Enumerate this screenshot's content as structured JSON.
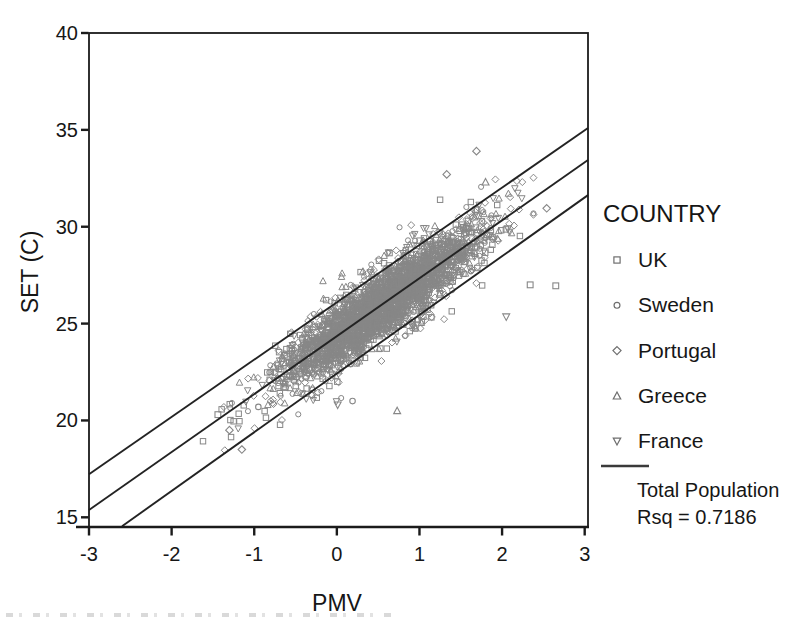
{
  "window": {
    "width": 793,
    "height": 618,
    "background": "#ffffff"
  },
  "chart_data": {
    "type": "scatter",
    "title": "",
    "xlabel": "PMV",
    "ylabel": "SET (C)",
    "xlim": [
      -3,
      3.04
    ],
    "ylim": [
      14.5,
      40
    ],
    "x_ticks": [
      -3,
      -2,
      -1,
      0,
      1,
      2,
      3
    ],
    "y_ticks": [
      15,
      20,
      25,
      30,
      35,
      40
    ],
    "grid": false,
    "legend_position": "right",
    "colors": {
      "marker": "#878787",
      "legend_marker": "#6e6e6e",
      "fit_line": "#232323",
      "axis": "#1b1b1b",
      "text": "#161616",
      "background": "#ffffff"
    },
    "fit_lines": [
      {
        "name": "upper-prediction-band",
        "slope": 2.96,
        "intercept": 26.1,
        "x_start": -3.0,
        "x_end": 3.04
      },
      {
        "name": "total-population-fit",
        "slope": 2.99,
        "intercept": 24.35,
        "x_start": -3.0,
        "x_end": 3.04
      },
      {
        "name": "lower-prediction-band",
        "slope": 3.03,
        "intercept": 22.42,
        "x_start": -2.6,
        "x_end": 3.04
      }
    ],
    "scatter_cloud": {
      "comment": "dense cloud of ~2800 overlapping open gray markers; generated deterministically from these parameters",
      "seed": 7,
      "n_core": 2600,
      "n_fringe": 170,
      "pmv_mean": 0.55,
      "pmv_sd": 0.6,
      "pmv_sd_fringe": 0.78,
      "pmv_min": -1.62,
      "pmv_max": 2.38,
      "fit_slope": 2.99,
      "fit_intercept": 24.35,
      "resid_sd": 0.85,
      "resid_clip": 2.45,
      "resid_sd_fringe": 1.55,
      "resid_clip_fringe": 3.35,
      "shapes": [
        "square",
        "circle",
        "diamond",
        "triangle-up",
        "triangle-down"
      ],
      "shape_weights": [
        0.3,
        0.17,
        0.23,
        0.2,
        0.1
      ]
    },
    "outlier_points": [
      {
        "shape": "diamond",
        "x": 1.69,
        "y": 33.9
      },
      {
        "shape": "diamond",
        "x": 1.33,
        "y": 32.7
      },
      {
        "shape": "triangle-up",
        "x": 1.8,
        "y": 32.3
      },
      {
        "shape": "diamond",
        "x": 2.54,
        "y": 30.95
      },
      {
        "shape": "triangle-down",
        "x": 2.07,
        "y": 29.9
      },
      {
        "shape": "square",
        "x": 2.34,
        "y": 27.0
      },
      {
        "shape": "square",
        "x": 2.65,
        "y": 26.95
      },
      {
        "shape": "triangle-down",
        "x": 2.05,
        "y": 25.35
      },
      {
        "shape": "triangle-down",
        "x": 0.01,
        "y": 20.8
      },
      {
        "shape": "circle",
        "x": 0.19,
        "y": 21.0
      },
      {
        "shape": "triangle-up",
        "x": 0.73,
        "y": 20.5
      },
      {
        "shape": "diamond",
        "x": -1.3,
        "y": 19.5
      },
      {
        "shape": "diamond",
        "x": -1.15,
        "y": 18.5
      },
      {
        "shape": "circle",
        "x": -0.95,
        "y": 20.7
      },
      {
        "shape": "square",
        "x": -1.44,
        "y": 20.3
      }
    ],
    "legend": {
      "title": "COUNTRY",
      "entries": [
        {
          "label": "UK",
          "marker": "square"
        },
        {
          "label": "Sweden",
          "marker": "circle"
        },
        {
          "label": "Portugal",
          "marker": "diamond"
        },
        {
          "label": "Greece",
          "marker": "triangle-up"
        },
        {
          "label": "France",
          "marker": "triangle-down"
        }
      ],
      "line_label": "Total Population",
      "rsq_label": "Rsq = 0.7186"
    }
  }
}
